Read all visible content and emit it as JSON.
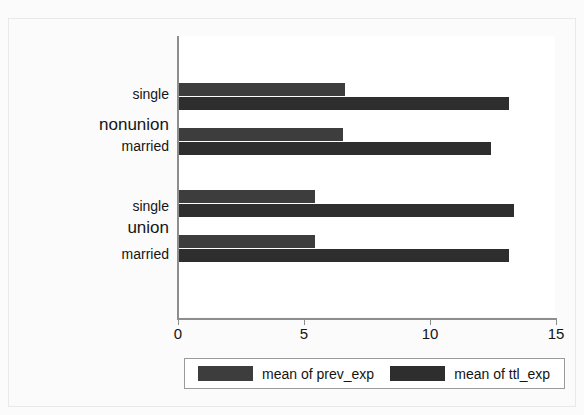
{
  "chart_data": {
    "type": "bar",
    "orientation": "horizontal",
    "title": "",
    "xlabel": "",
    "ylabel": "",
    "xlim": [
      0,
      15
    ],
    "xticks": [
      0,
      5,
      10,
      15
    ],
    "xtick_labels": [
      "0",
      "5",
      "10",
      "15"
    ],
    "grid": false,
    "legend_position": "bottom",
    "groups": [
      {
        "name": "nonunion",
        "categories": [
          "single",
          "married"
        ]
      },
      {
        "name": "union",
        "categories": [
          "single",
          "married"
        ]
      }
    ],
    "categories": [
      "nonunion single",
      "nonunion married",
      "union single",
      "union married"
    ],
    "series": [
      {
        "name": "mean of prev_exp",
        "color": "#3d3d3d",
        "values": [
          6.6,
          6.5,
          5.4,
          5.4
        ]
      },
      {
        "name": "mean of ttl_exp",
        "color": "#2e2e2e",
        "values": [
          13.1,
          12.4,
          13.3,
          13.1
        ]
      }
    ]
  },
  "axis": {
    "ticks": [
      {
        "label": "0",
        "value": 0
      },
      {
        "label": "5",
        "value": 5
      },
      {
        "label": "10",
        "value": 10
      },
      {
        "label": "15",
        "value": 15
      }
    ]
  },
  "labels": {
    "group_nonunion": "nonunion",
    "group_union": "union",
    "nonunion_single": "single",
    "nonunion_married": "married",
    "union_single": "single",
    "union_married": "married"
  },
  "legend": {
    "entries": [
      {
        "label": "mean of prev_exp",
        "color": "#3d3d3d"
      },
      {
        "label": "mean of ttl_exp",
        "color": "#2e2e2e"
      }
    ]
  },
  "bars": [
    {
      "name": "nonunion-single-prev",
      "value": 6.6,
      "series": "mean of prev_exp"
    },
    {
      "name": "nonunion-single-ttl",
      "value": 13.1,
      "series": "mean of ttl_exp"
    },
    {
      "name": "nonunion-married-prev",
      "value": 6.5,
      "series": "mean of prev_exp"
    },
    {
      "name": "nonunion-married-ttl",
      "value": 12.4,
      "series": "mean of ttl_exp"
    },
    {
      "name": "union-single-prev",
      "value": 5.4,
      "series": "mean of prev_exp"
    },
    {
      "name": "union-single-ttl",
      "value": 13.3,
      "series": "mean of ttl_exp"
    },
    {
      "name": "union-married-prev",
      "value": 5.4,
      "series": "mean of prev_exp"
    },
    {
      "name": "union-married-ttl",
      "value": 13.1,
      "series": "mean of ttl_exp"
    }
  ]
}
